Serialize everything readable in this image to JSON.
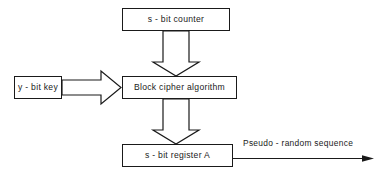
{
  "diagram": {
    "type": "block-diagram",
    "background_color": "#ffffff",
    "line_color": "#1a1a1a",
    "blocks": [
      {
        "id": "counter",
        "label": "s - bit  counter"
      },
      {
        "id": "key",
        "label": "y - bit  key"
      },
      {
        "id": "cipher",
        "label": "Block  cipher  algorithm"
      },
      {
        "id": "register",
        "label": "s - bit  register A"
      }
    ],
    "connectors": [
      {
        "id": "counter-to-cipher",
        "style": "hollow-arrow",
        "direction": "down",
        "from": "counter",
        "to": "cipher",
        "label": ""
      },
      {
        "id": "key-to-cipher",
        "style": "hollow-arrow",
        "direction": "right",
        "from": "key",
        "to": "cipher",
        "label": ""
      },
      {
        "id": "cipher-to-register",
        "style": "hollow-arrow",
        "direction": "down",
        "from": "cipher",
        "to": "register",
        "label": ""
      },
      {
        "id": "register-output",
        "style": "line-arrow",
        "direction": "right",
        "from": "register",
        "to": "",
        "label": "Pseudo - random  sequence"
      }
    ]
  }
}
